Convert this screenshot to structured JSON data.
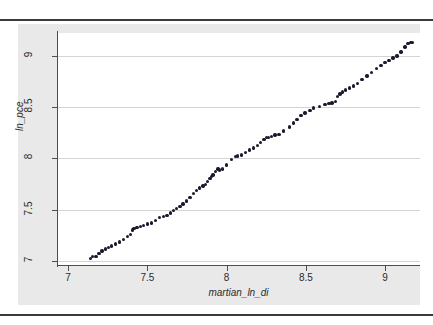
{
  "figure": {
    "background_color": "#ffffff",
    "graph_region_color": "#e9e9e9",
    "plot_area_color": "#ffffff",
    "rule_color": "#3a3a3a"
  },
  "chart_data": {
    "type": "scatter",
    "title": "",
    "xlabel": "martian_ln_di",
    "ylabel": "ln_pce",
    "xlim": [
      6.93,
      9.22
    ],
    "ylim": [
      6.96,
      9.22
    ],
    "xticks": [
      7,
      7.5,
      8,
      8.5,
      9
    ],
    "xticklabels": [
      "7",
      "7.5",
      "8",
      "8.5",
      "9"
    ],
    "yticks": [
      7,
      7.5,
      8,
      8.5,
      9
    ],
    "yticklabels": [
      "7",
      "7.5",
      "8",
      "8.5",
      "9"
    ],
    "grid": "horizontal",
    "legend": null,
    "marker_color": "#1a1a2e",
    "marker_size": 3.4,
    "series": [
      {
        "name": "ln_pce vs martian_ln_di",
        "x": [
          7.14,
          7.155,
          7.175,
          7.195,
          7.215,
          7.235,
          7.255,
          7.275,
          7.3,
          7.325,
          7.35,
          7.375,
          7.395,
          7.405,
          7.415,
          7.435,
          7.455,
          7.475,
          7.5,
          7.525,
          7.55,
          7.575,
          7.6,
          7.625,
          7.645,
          7.665,
          7.685,
          7.705,
          7.725,
          7.745,
          7.77,
          7.79,
          7.81,
          7.83,
          7.85,
          7.865,
          7.88,
          7.895,
          7.905,
          7.915,
          7.93,
          7.945,
          7.955,
          7.975,
          8.0,
          8.03,
          8.055,
          8.07,
          8.095,
          8.12,
          8.145,
          8.17,
          8.195,
          8.215,
          8.235,
          8.25,
          8.265,
          8.285,
          8.305,
          8.33,
          8.36,
          8.395,
          8.42,
          8.445,
          8.47,
          8.495,
          8.525,
          8.55,
          8.585,
          8.62,
          8.645,
          8.665,
          8.685,
          8.7,
          8.715,
          8.73,
          8.75,
          8.775,
          8.8,
          8.825,
          8.855,
          8.885,
          8.915,
          8.945,
          8.975,
          9.0,
          9.025,
          9.05,
          9.075,
          9.1,
          9.125,
          9.145,
          9.16,
          9.17
        ],
        "y": [
          7.025,
          7.04,
          7.045,
          7.075,
          7.095,
          7.115,
          7.13,
          7.145,
          7.165,
          7.185,
          7.21,
          7.235,
          7.26,
          7.3,
          7.315,
          7.325,
          7.335,
          7.345,
          7.36,
          7.37,
          7.395,
          7.42,
          7.435,
          7.445,
          7.465,
          7.49,
          7.51,
          7.53,
          7.555,
          7.585,
          7.62,
          7.655,
          7.685,
          7.71,
          7.73,
          7.745,
          7.775,
          7.805,
          7.82,
          7.835,
          7.87,
          7.895,
          7.885,
          7.895,
          7.935,
          7.985,
          8.015,
          8.02,
          8.03,
          8.055,
          8.08,
          8.1,
          8.125,
          8.155,
          8.185,
          8.2,
          8.205,
          8.21,
          8.225,
          8.23,
          8.265,
          8.305,
          8.345,
          8.38,
          8.415,
          8.44,
          8.465,
          8.49,
          8.505,
          8.525,
          8.535,
          8.54,
          8.555,
          8.6,
          8.625,
          8.645,
          8.665,
          8.685,
          8.705,
          8.73,
          8.765,
          8.8,
          8.835,
          8.875,
          8.905,
          8.935,
          8.955,
          8.975,
          8.995,
          9.035,
          9.085,
          9.115,
          9.125,
          9.13
        ]
      }
    ]
  }
}
